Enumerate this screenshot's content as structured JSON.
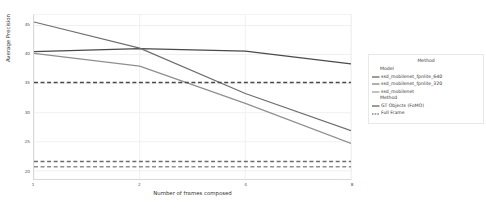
{
  "chart_data": {
    "type": "line",
    "title": "",
    "xlabel": "Number of frames composed",
    "ylabel": "Average Precision",
    "x": [
      1,
      2,
      4,
      8
    ],
    "xticks": [
      "1",
      "2",
      "4",
      "8"
    ],
    "yticks": [
      "45",
      "40",
      "35",
      "30",
      "25",
      "20"
    ],
    "ylim": [
      18.6,
      46.8
    ],
    "xscale": "log2",
    "grid": true,
    "legend_position": "right-outside",
    "series": [
      {
        "name": "ssd_mobilenet_fpnlite_640",
        "method": "GT Objects (FoMO)",
        "style": "solid",
        "color": "#4a4a4a",
        "values": [
          40.5,
          41.0,
          40.6,
          38.4
        ]
      },
      {
        "name": "ssd_mobilenet_fpnlite_320",
        "method": "GT Objects (FoMO)",
        "style": "solid",
        "color": "#6e6e6e",
        "values": [
          45.6,
          41.1,
          33.3,
          26.9
        ]
      },
      {
        "name": "ssd_mobilenet",
        "method": "GT Objects (FoMO)",
        "style": "solid",
        "color": "#8f8f8f",
        "values": [
          40.2,
          38.0,
          31.6,
          24.7
        ]
      },
      {
        "name": "ssd_mobilenet_fpnlite_640",
        "method": "Full Frame",
        "style": "dashed",
        "color": "#4a4a4a",
        "values": [
          35.2,
          35.2,
          35.2,
          35.2
        ]
      },
      {
        "name": "ssd_mobilenet_fpnlite_320",
        "method": "Full Frame",
        "style": "dashed",
        "color": "#6e6e6e",
        "values": [
          21.6,
          21.6,
          21.6,
          21.6
        ]
      },
      {
        "name": "ssd_mobilenet",
        "method": "Full Frame",
        "style": "dashed",
        "color": "#8f8f8f",
        "values": [
          20.7,
          20.7,
          20.7,
          20.7
        ]
      }
    ]
  },
  "legend": {
    "title": "Method",
    "groups": [
      {
        "heading": "Model",
        "entries": [
          {
            "label": "ssd_mobilenet_fpnlite_640",
            "swatch": "line-solid",
            "color": "#4a4a4a"
          },
          {
            "label": "ssd_mobilenet_fpnlite_320",
            "swatch": "line-solid",
            "color": "#6e6e6e"
          },
          {
            "label": "ssd_mobilenet",
            "swatch": "line-solid",
            "color": "#8f8f8f"
          }
        ]
      },
      {
        "heading": "Method",
        "entries": [
          {
            "label": "GT Objects (FoMO)",
            "swatch": "line-solid",
            "color": "#4a4a4a"
          },
          {
            "label": "Full Frame",
            "swatch": "line-dashed",
            "color": "#4a4a4a"
          }
        ]
      }
    ]
  }
}
